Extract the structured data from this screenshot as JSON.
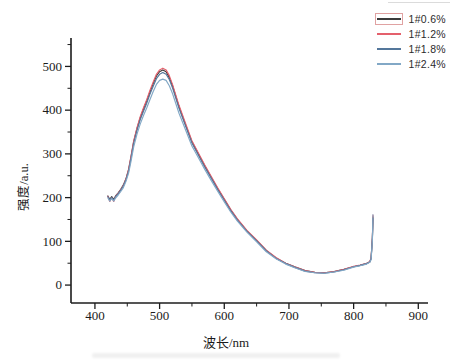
{
  "figure": {
    "background": "#ffffff",
    "axis_color": "#1c1c1c"
  },
  "legend": {
    "box_outline_color": "#e0a2a2",
    "entries": [
      {
        "label": "1#0.6%",
        "color": "#3b3b3b",
        "boxed": true
      },
      {
        "label": "1#1.2%",
        "color": "#e4606c",
        "boxed": false
      },
      {
        "label": "1#1.8%",
        "color": "#54779b",
        "boxed": false
      },
      {
        "label": "1#2.4%",
        "color": "#82a8c6",
        "boxed": false
      }
    ]
  },
  "chart_data": {
    "type": "line",
    "title": "",
    "xlabel": "波长/nm",
    "ylabel": "强度/a.u.",
    "xlim": [
      363,
      915
    ],
    "ylim": [
      -41,
      565
    ],
    "x_ticks": [
      400,
      500,
      600,
      700,
      800,
      900
    ],
    "y_ticks": [
      0,
      100,
      200,
      300,
      400,
      500
    ],
    "x_minor_ticks": [
      450,
      550,
      650,
      750,
      850
    ],
    "y_minor_ticks": [
      50,
      150,
      250,
      350,
      450,
      550
    ],
    "grid": false,
    "legend_position": "top-right",
    "x": [
      420,
      423,
      426,
      429,
      432,
      436,
      440,
      444,
      448,
      452,
      456,
      460,
      465,
      470,
      475,
      480,
      485,
      490,
      495,
      500,
      505,
      510,
      515,
      520,
      530,
      540,
      550,
      560,
      570,
      580,
      590,
      600,
      610,
      620,
      635,
      650,
      665,
      680,
      695,
      710,
      725,
      740,
      755,
      770,
      785,
      800,
      810,
      820,
      825,
      827,
      829,
      830
    ],
    "series": [
      {
        "name": "1#0.6%",
        "color": "#3b3b3b",
        "values": [
          204,
          196,
          202,
          196,
          204,
          211,
          219,
          229,
          243,
          264,
          294,
          328,
          358,
          382,
          402,
          421,
          441,
          460,
          478,
          488,
          492,
          488,
          475,
          456,
          408,
          367,
          328,
          300,
          272,
          246,
          220,
          196,
          172,
          151,
          124,
          102,
          79,
          62,
          50,
          41,
          33,
          29,
          28,
          31,
          36,
          42,
          45,
          49,
          53,
          61,
          108,
          156
        ]
      },
      {
        "name": "1#1.2%",
        "color": "#e4606c",
        "values": [
          203,
          191,
          200,
          191,
          203,
          210,
          218,
          228,
          243,
          265,
          296,
          330,
          360,
          385,
          405,
          424,
          445,
          464,
          482,
          492,
          496,
          492,
          479,
          459,
          411,
          370,
          330,
          302,
          274,
          248,
          222,
          197,
          173,
          152,
          125,
          103,
          80,
          63,
          50,
          41,
          33,
          29,
          28,
          31,
          36,
          43,
          46,
          50,
          54,
          62,
          110,
          160
        ]
      },
      {
        "name": "1#1.8%",
        "color": "#54779b",
        "values": [
          202,
          194,
          200,
          194,
          202,
          209,
          217,
          227,
          241,
          261,
          291,
          324,
          354,
          378,
          397,
          416,
          436,
          454,
          472,
          482,
          486,
          482,
          470,
          451,
          404,
          364,
          325,
          297,
          269,
          244,
          218,
          194,
          170,
          149,
          123,
          101,
          78,
          61,
          49,
          40,
          32,
          28,
          27,
          30,
          35,
          42,
          45,
          49,
          53,
          60,
          106,
          153
        ]
      },
      {
        "name": "1#2.4%",
        "color": "#82a8c6",
        "values": [
          199,
          192,
          198,
          192,
          199,
          206,
          214,
          223,
          237,
          256,
          284,
          316,
          345,
          368,
          387,
          405,
          424,
          442,
          459,
          468,
          471,
          468,
          456,
          438,
          393,
          355,
          318,
          291,
          264,
          239,
          214,
          190,
          167,
          147,
          121,
          99,
          76,
          60,
          48,
          39,
          31,
          28,
          27,
          30,
          34,
          41,
          44,
          48,
          52,
          58,
          103,
          161
        ]
      }
    ]
  }
}
